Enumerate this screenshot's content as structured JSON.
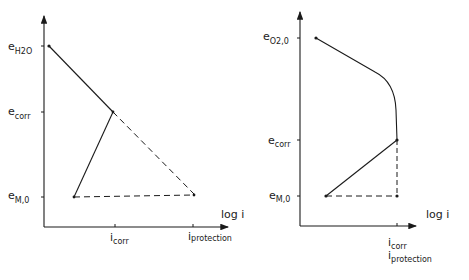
{
  "diagrams": [
    {
      "id": "left",
      "description": "Evans diagram: hydrogen evolution cathodic line and metal anodic line",
      "y_axis_labels": {
        "top": {
          "main": "e",
          "sub": "H2O"
        },
        "mid": {
          "main": "e",
          "sub": "corr"
        },
        "bottom": {
          "main": "e",
          "sub": "M,0"
        }
      },
      "x_axis_label": "log i",
      "x_ticks": [
        {
          "main": "i",
          "sub": "corr"
        },
        {
          "main": "i",
          "sub": "protection"
        }
      ]
    },
    {
      "id": "right",
      "description": "Evans diagram: oxygen reduction with diffusion-limited current and metal anodic line",
      "y_axis_labels": {
        "top": {
          "main": "e",
          "sub": "O2,0"
        },
        "mid": {
          "main": "e",
          "sub": "corr"
        },
        "bottom": {
          "main": "e",
          "sub": "M,0"
        }
      },
      "x_axis_label": "log i",
      "x_ticks": [
        {
          "main": "i",
          "sub": "corr"
        },
        {
          "main": "i",
          "sub": "protection"
        }
      ]
    }
  ],
  "colors": {
    "ink": "#1a1a1a",
    "background": "#ffffff"
  }
}
